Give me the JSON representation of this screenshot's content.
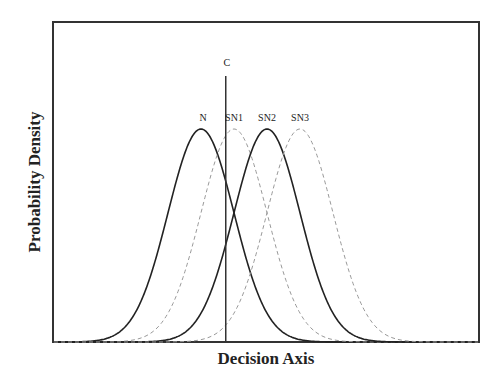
{
  "chart_data": {
    "type": "line",
    "title": "",
    "xlabel": "Decision Axis",
    "ylabel": "Probability Density",
    "grid": false,
    "legend": "inline labels above peaks",
    "x_range": [
      -3.4,
      9.6
    ],
    "y_range": [
      0,
      1.0
    ],
    "criterion": {
      "label": "C",
      "x": 0.75
    },
    "series": [
      {
        "name": "N",
        "mean": 0.0,
        "sd": 1.0,
        "style": "solid",
        "color": "#222222"
      },
      {
        "name": "SN1",
        "mean": 1.0,
        "sd": 1.0,
        "style": "dashed",
        "color": "#999999"
      },
      {
        "name": "SN2",
        "mean": 2.0,
        "sd": 1.0,
        "style": "solid",
        "color": "#222222"
      },
      {
        "name": "SN3",
        "mean": 3.0,
        "sd": 1.0,
        "style": "dashed",
        "color": "#999999"
      }
    ]
  },
  "layout": {
    "frame": {
      "x0": 53,
      "y0": 22,
      "x1": 479,
      "y1": 342
    },
    "peak_y": 129,
    "px_per_sd": 33,
    "mean0_px": 201,
    "criterion_top_y": 76
  }
}
